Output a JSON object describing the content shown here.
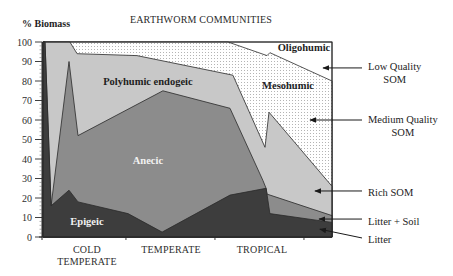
{
  "chart_data": {
    "type": "area",
    "stacked": true,
    "title": "EARTHWORM COMMUNITIES",
    "ylabel": "% Biomass",
    "xlabel": "",
    "xlim": [
      0,
      100
    ],
    "ylim": [
      0,
      100
    ],
    "grid": false,
    "legend": "none",
    "yticks": [
      0,
      10,
      20,
      30,
      40,
      50,
      60,
      70,
      80,
      90,
      100
    ],
    "ytick_labels": [
      "0",
      "10",
      "20",
      "30",
      "40",
      "50",
      "60",
      "70",
      "80",
      "90",
      "100"
    ],
    "xticks": [
      28.7,
      59.5,
      90.3
    ],
    "categories": [
      {
        "lines": [
          "COLD",
          "TEMPERATE"
        ],
        "x": 15.2
      },
      {
        "lines": [
          "TEMPERATE"
        ],
        "x": 44.3
      },
      {
        "lines": [
          "TROPICAL"
        ],
        "x": 75.8
      }
    ],
    "series": [
      {
        "name": "Epigeic",
        "fill": "#3d3d3d",
        "label_color": "#f2f2f2",
        "label_at": [
          15.2,
          7.7
        ],
        "top": [
          [
            0,
            100
          ],
          [
            0.7,
            100
          ],
          [
            2.8,
            16
          ],
          [
            9.0,
            24
          ],
          [
            12.1,
            18
          ],
          [
            29.4,
            12
          ],
          [
            41.2,
            2.5
          ],
          [
            64.7,
            21.5
          ],
          [
            77.2,
            25
          ],
          [
            78.5,
            12
          ],
          [
            100,
            7.5
          ]
        ]
      },
      {
        "name": "Anecic",
        "fill": "#8c8c8c",
        "label_color": "#f2f2f2",
        "label_at": [
          36.3,
          39
        ],
        "top": [
          [
            0,
            100
          ],
          [
            0.7,
            100
          ],
          [
            2.8,
            16
          ],
          [
            9.0,
            90
          ],
          [
            12.1,
            52
          ],
          [
            41.5,
            75
          ],
          [
            64.7,
            66
          ],
          [
            76.1,
            29
          ],
          [
            77.2,
            25
          ],
          [
            77.5,
            22
          ],
          [
            100,
            11
          ]
        ]
      },
      {
        "name": "Polyhumic endogeic",
        "fill": "#c8c8c8",
        "label_color": "#1e1e1e",
        "label_at": [
          36.3,
          80
        ],
        "top": [
          [
            0,
            100
          ],
          [
            9.3,
            100
          ],
          [
            11.8,
            94
          ],
          [
            32.5,
            93
          ],
          [
            65.7,
            83
          ],
          [
            76.8,
            46
          ],
          [
            78.2,
            64
          ],
          [
            100,
            26
          ]
        ]
      },
      {
        "name": "Mesohumic",
        "fill": "#ffffff",
        "pattern": "dots",
        "pattern_color": "#b4b4b4",
        "label_color": "#1e1e1e",
        "label_at": [
          84.8,
          77.9
        ],
        "top": [
          [
            0,
            100
          ],
          [
            64.0,
            100
          ],
          [
            77.5,
            93
          ],
          [
            78.5,
            94.5
          ],
          [
            100,
            80
          ]
        ]
      },
      {
        "name": "Oligohumic",
        "fill": "#ffffff",
        "label_color": "#1e1e1e",
        "label_at": [
          90.3,
          97.4
        ],
        "top": [
          [
            0,
            100
          ],
          [
            100,
            100
          ]
        ]
      }
    ],
    "annotations": [
      {
        "lines": [
          "Low Quality",
          "SOM"
        ],
        "target": [
          96.9,
          86.7
        ],
        "label_y": 86.7
      },
      {
        "lines": [
          "Medium Quality",
          "SOM"
        ],
        "target": [
          92.4,
          60
        ],
        "label_y": 60
      },
      {
        "lines": [
          "Rich SOM"
        ],
        "target": [
          94.1,
          23.6
        ],
        "label_y": 23.6
      },
      {
        "lines": [
          "Litter + Soil"
        ],
        "target": [
          95.5,
          9.2
        ],
        "label_y": 9.2
      },
      {
        "lines": [
          "Litter"
        ],
        "target": [
          95.8,
          4
        ],
        "label_y": -0.5
      }
    ]
  }
}
